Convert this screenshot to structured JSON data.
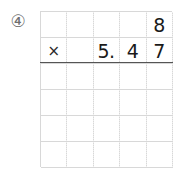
{
  "problem": {
    "number_label": "④",
    "operation_symbol": "×",
    "multiplicand": "8",
    "multiplier": "5.47",
    "equation_text": "8 × 5.47"
  },
  "grid": {
    "columns": 5,
    "rows": 6,
    "line_color": "#d8d8d8",
    "rule_color": "#555555",
    "digit_color": "#1a1a1a",
    "number_label_color": "#6f6f6f",
    "background_color": "#ffffff",
    "cells": [
      [
        "",
        "",
        "",
        "",
        "8"
      ],
      [
        "×",
        "",
        "5.",
        "4",
        "7"
      ],
      [
        "",
        "",
        "",
        "",
        ""
      ],
      [
        "",
        "",
        "",
        "",
        ""
      ],
      [
        "",
        "",
        "",
        "",
        ""
      ],
      [
        "",
        "",
        "",
        "",
        ""
      ]
    ]
  }
}
